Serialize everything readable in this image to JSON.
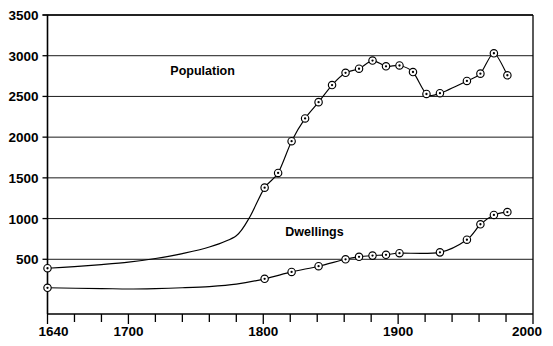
{
  "chart_data": {
    "type": "line",
    "title": "",
    "xlabel": "",
    "ylabel": "",
    "xlim": [
      1640,
      2000
    ],
    "ylim": [
      0,
      3500
    ],
    "grid": true,
    "grid_axis": "y",
    "legend": "inline-annotations",
    "x_ticks_labeled": [
      1640,
      1700,
      1800,
      1900,
      2000
    ],
    "x_tick_labels": [
      "1640",
      "1700",
      "1800",
      "1900",
      "2000"
    ],
    "x_minor_tick_step": 20,
    "y_ticks": [
      500,
      1000,
      1500,
      2000,
      2500,
      3000,
      3500
    ],
    "y_tick_labels": [
      "500",
      "1000",
      "1500",
      "2000",
      "2500",
      "3000",
      "3500"
    ],
    "series": [
      {
        "name": "Population",
        "annotation": "Population",
        "annotation_x": 1755,
        "annotation_y": 2760,
        "marker": "circle-dot",
        "points": [
          {
            "x": 1640,
            "y": 390,
            "marker": true
          },
          {
            "x": 1660,
            "y": 410,
            "marker": false
          },
          {
            "x": 1680,
            "y": 435,
            "marker": false
          },
          {
            "x": 1700,
            "y": 465,
            "marker": false
          },
          {
            "x": 1720,
            "y": 510,
            "marker": false
          },
          {
            "x": 1740,
            "y": 570,
            "marker": false
          },
          {
            "x": 1760,
            "y": 650,
            "marker": false
          },
          {
            "x": 1780,
            "y": 790,
            "marker": false
          },
          {
            "x": 1790,
            "y": 1020,
            "marker": false
          },
          {
            "x": 1801,
            "y": 1380,
            "marker": true
          },
          {
            "x": 1811,
            "y": 1560,
            "marker": true
          },
          {
            "x": 1821,
            "y": 1950,
            "marker": true
          },
          {
            "x": 1831,
            "y": 2230,
            "marker": true
          },
          {
            "x": 1841,
            "y": 2430,
            "marker": true
          },
          {
            "x": 1851,
            "y": 2640,
            "marker": true
          },
          {
            "x": 1861,
            "y": 2790,
            "marker": true
          },
          {
            "x": 1871,
            "y": 2840,
            "marker": true
          },
          {
            "x": 1881,
            "y": 2940,
            "marker": true
          },
          {
            "x": 1891,
            "y": 2870,
            "marker": true
          },
          {
            "x": 1901,
            "y": 2880,
            "marker": true
          },
          {
            "x": 1911,
            "y": 2800,
            "marker": true
          },
          {
            "x": 1921,
            "y": 2530,
            "marker": true
          },
          {
            "x": 1931,
            "y": 2540,
            "marker": true
          },
          {
            "x": 1951,
            "y": 2690,
            "marker": true
          },
          {
            "x": 1961,
            "y": 2780,
            "marker": true
          },
          {
            "x": 1971,
            "y": 3030,
            "marker": true
          },
          {
            "x": 1981,
            "y": 2760,
            "marker": true
          }
        ]
      },
      {
        "name": "Dwellings",
        "annotation": "Dwellings",
        "annotation_x": 1838,
        "annotation_y": 790,
        "marker": "circle-dot",
        "points": [
          {
            "x": 1640,
            "y": 150,
            "marker": true
          },
          {
            "x": 1680,
            "y": 140,
            "marker": false
          },
          {
            "x": 1700,
            "y": 135,
            "marker": false
          },
          {
            "x": 1720,
            "y": 140,
            "marker": false
          },
          {
            "x": 1740,
            "y": 150,
            "marker": false
          },
          {
            "x": 1760,
            "y": 165,
            "marker": false
          },
          {
            "x": 1780,
            "y": 195,
            "marker": false
          },
          {
            "x": 1801,
            "y": 260,
            "marker": true
          },
          {
            "x": 1821,
            "y": 345,
            "marker": true
          },
          {
            "x": 1841,
            "y": 415,
            "marker": true
          },
          {
            "x": 1861,
            "y": 500,
            "marker": true
          },
          {
            "x": 1871,
            "y": 530,
            "marker": true
          },
          {
            "x": 1881,
            "y": 545,
            "marker": true
          },
          {
            "x": 1891,
            "y": 555,
            "marker": true
          },
          {
            "x": 1901,
            "y": 575,
            "marker": true
          },
          {
            "x": 1931,
            "y": 585,
            "marker": true
          },
          {
            "x": 1951,
            "y": 740,
            "marker": true
          },
          {
            "x": 1961,
            "y": 930,
            "marker": true
          },
          {
            "x": 1971,
            "y": 1045,
            "marker": true
          },
          {
            "x": 1981,
            "y": 1080,
            "marker": true
          }
        ]
      }
    ]
  },
  "axes": {
    "y_labels": [
      "3500",
      "3000",
      "2500",
      "2000",
      "1500",
      "1000",
      "500"
    ],
    "x_labels": [
      "1640",
      "1700",
      "1800",
      "1900",
      "2000"
    ]
  },
  "annotations": {
    "population": "Population",
    "dwellings": "Dwellings"
  },
  "colors": {
    "line": "#000000",
    "grid": "#1a1a1a",
    "background": "#ffffff",
    "text": "#000000"
  }
}
